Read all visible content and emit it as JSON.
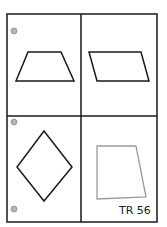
{
  "card": {
    "code_label": "TR 56",
    "border_color": "#1a1a1a",
    "background": "#ffffff"
  },
  "grid": {
    "rows": 2,
    "cols": 2,
    "outer": {
      "x": 7,
      "y": 14,
      "width": 150,
      "height": 208
    },
    "divider_x": 81,
    "divider_y": 116
  },
  "punch_holes": [
    {
      "cx": 14,
      "cy": 31,
      "r": 3
    },
    {
      "cx": 14,
      "cy": 122,
      "r": 3
    },
    {
      "cx": 14,
      "cy": 209,
      "r": 3
    }
  ],
  "shapes": [
    {
      "name": "trapezoid",
      "cell": "top-left",
      "points": "28,52 61,52 74,81 16,81",
      "stroke": "#1a1a1a"
    },
    {
      "name": "parallelogram",
      "cell": "top-right",
      "points": "89,52 141,52 149,81 97,81",
      "stroke": "#1a1a1a"
    },
    {
      "name": "rhombus",
      "cell": "bottom-left",
      "points": "44,131 72,167 44,201 17,167",
      "stroke": "#1a1a1a"
    },
    {
      "name": "right-trapezoid",
      "cell": "bottom-right",
      "points": "97,146 136,146 146,197 97,199",
      "stroke": "#9a9a9a"
    }
  ]
}
